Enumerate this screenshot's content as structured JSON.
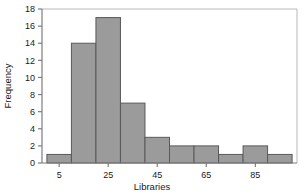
{
  "chart_data": {
    "type": "bar",
    "title": "",
    "subtitle": "",
    "xlabel": "Libraries",
    "ylabel": "Frequency",
    "categories": [
      "0-10",
      "10-20",
      "20-30",
      "30-40",
      "40-50",
      "50-60",
      "60-70",
      "70-80",
      "80-90",
      "90-100"
    ],
    "bin_edges": [
      0,
      10,
      20,
      30,
      40,
      50,
      60,
      70,
      80,
      90,
      100
    ],
    "values": [
      1,
      14,
      17,
      7,
      3,
      2,
      2,
      1,
      2,
      1
    ],
    "x": [
      5,
      15,
      25,
      35,
      45,
      55,
      65,
      75,
      85,
      95
    ],
    "xlim": [
      -2,
      102
    ],
    "ylim": [
      0,
      18
    ],
    "xticks": [
      5,
      25,
      45,
      65,
      85
    ],
    "xticklabels": [
      "5",
      "25",
      "45",
      "65",
      "85"
    ],
    "yticks": [
      0,
      2,
      4,
      6,
      8,
      10,
      12,
      14,
      16,
      18
    ],
    "yticklabels": [
      "0",
      "2",
      "4",
      "6",
      "8",
      "10",
      "12",
      "14",
      "16",
      "18"
    ],
    "grid": false,
    "legend": null,
    "bar_fill_color": "#9b9b9b",
    "bar_edge_color": "#5a5a5a",
    "axis_color": "#7d7d7d",
    "frame_color": "#b8b8b8",
    "text_color": "#1a1a1a"
  }
}
